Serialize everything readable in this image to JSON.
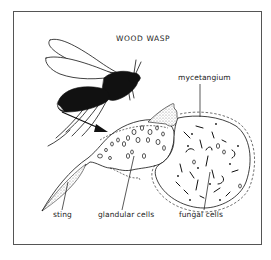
{
  "figure": {
    "title": "WOOD WASP",
    "labels": {
      "mycetangium": "mycetangium",
      "sting": "sting",
      "glandular_cells": "glandular cells",
      "fungal_cells": "fungal cells"
    },
    "colors": {
      "ink": "#111111",
      "frame": "#555555",
      "stipple": "#bdbdbd",
      "background": "#ffffff"
    }
  }
}
